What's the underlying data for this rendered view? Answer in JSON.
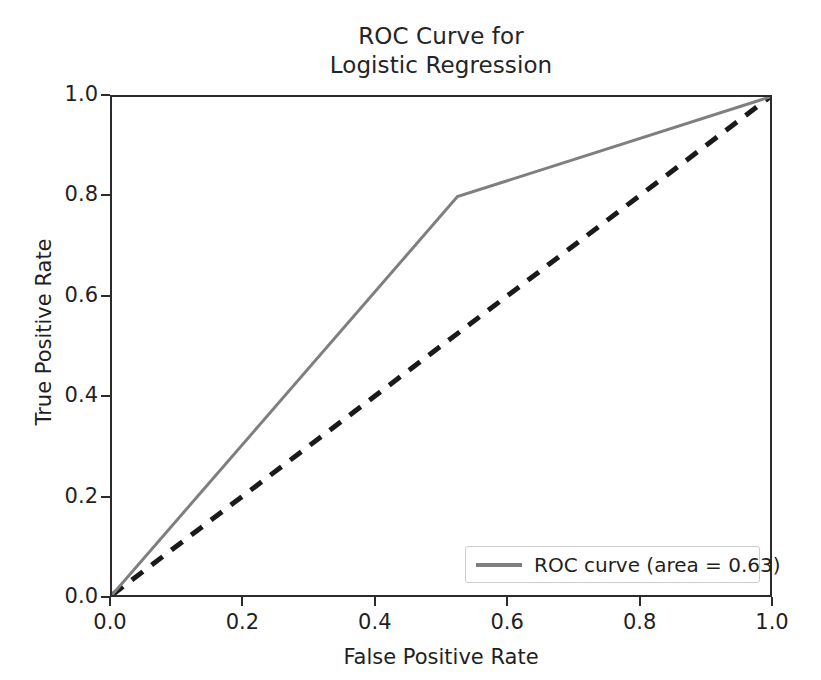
{
  "chart_data": {
    "type": "line",
    "title": "ROC Curve for\nLogistic Regression",
    "title_line1": "ROC Curve for",
    "title_line2": "Logistic Regression",
    "xlabel": "False Positive Rate",
    "ylabel": "True Positive Rate",
    "xlim": [
      0.0,
      1.0
    ],
    "ylim": [
      0.0,
      1.0
    ],
    "grid": false,
    "legend_position": "lower right",
    "xticks": [
      "0.0",
      "0.2",
      "0.4",
      "0.6",
      "0.8",
      "1.0"
    ],
    "xtick_values": [
      0.0,
      0.2,
      0.4,
      0.6,
      0.8,
      1.0
    ],
    "yticks": [
      "0.0",
      "0.2",
      "0.4",
      "0.6",
      "0.8",
      "1.0"
    ],
    "ytick_values": [
      0.0,
      0.2,
      0.4,
      0.6,
      0.8,
      1.0
    ],
    "series": [
      {
        "name": "ROC curve (area = 0.63)",
        "style": "solid",
        "color": "#7f7f7f",
        "linewidth": 3,
        "x": [
          0.0,
          0.525,
          1.0
        ],
        "y": [
          0.0,
          0.8,
          1.0
        ]
      },
      {
        "name": "chance-diagonal",
        "style": "dashed",
        "color": "#1a1a1a",
        "linewidth": 5,
        "x": [
          0.0,
          1.0
        ],
        "y": [
          0.0,
          1.0
        ]
      }
    ],
    "auc": 0.63
  },
  "legend": {
    "entries": [
      {
        "label": "ROC curve (area = 0.63)",
        "color": "#7f7f7f"
      }
    ]
  },
  "colors": {
    "roc_line": "#7f7f7f",
    "diagonal": "#1a1a1a",
    "axis": "#2b2b2b",
    "text": "#1f1f1f",
    "background": "#ffffff"
  }
}
